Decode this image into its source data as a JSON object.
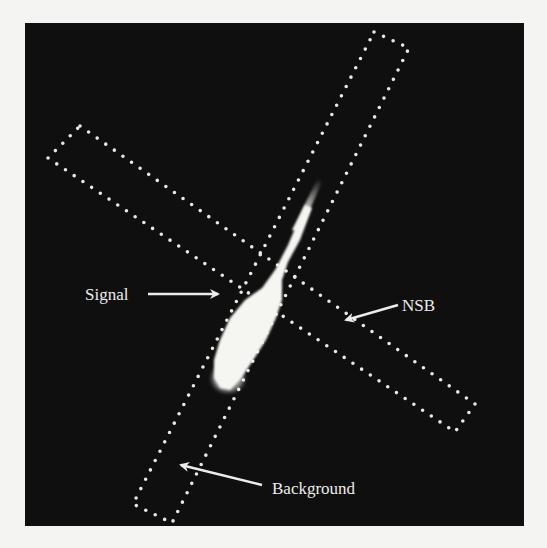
{
  "figure": {
    "labels": {
      "signal": "Signal",
      "nsb": "NSB",
      "background": "Background"
    },
    "regions": [
      {
        "name": "signal",
        "shape": "comet-shaped bright spot"
      },
      {
        "name": "nsb",
        "shape": "dotted rotated rectangle"
      },
      {
        "name": "background",
        "shape": "dotted rotated rectangle"
      }
    ],
    "colors": {
      "panel_background": "#0f0f0f",
      "dots": "#e8e8e8",
      "signal": "#f5f5f2",
      "text": "#ececec",
      "page": "#f4f4f2"
    }
  }
}
